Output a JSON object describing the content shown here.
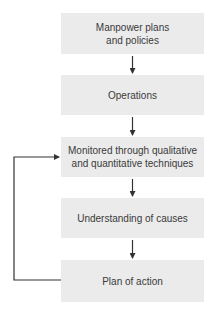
{
  "diagram": {
    "type": "flowchart",
    "nodes": [
      {
        "id": "n1",
        "label": "Manpower plans\nand policies"
      },
      {
        "id": "n2",
        "label": "Operations"
      },
      {
        "id": "n3",
        "label": "Monitored through qualitative\nand quantitative techniques"
      },
      {
        "id": "n4",
        "label": "Understanding of causes"
      },
      {
        "id": "n5",
        "label": "Plan of action"
      }
    ],
    "edges": [
      {
        "from": "n1",
        "to": "n2"
      },
      {
        "from": "n2",
        "to": "n3"
      },
      {
        "from": "n3",
        "to": "n4"
      },
      {
        "from": "n4",
        "to": "n5"
      },
      {
        "from": "n5",
        "to": "n3",
        "kind": "feedback-loop"
      }
    ],
    "colors": {
      "box_fill": "#ebebeb",
      "text": "#3a3a3a",
      "arrow": "#333333"
    }
  }
}
